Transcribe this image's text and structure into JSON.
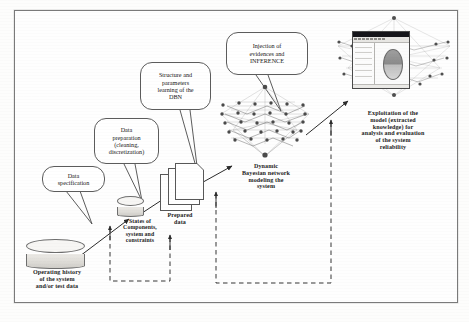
{
  "figure": {
    "border_color": "#7a7a7a"
  },
  "callouts": [
    {
      "id": "data-specification",
      "text": "Data\nspecification"
    },
    {
      "id": "data-preparation",
      "text": "Data\npreparation\n(cleaning,\ndiscretization)"
    },
    {
      "id": "structure-parameters",
      "text": "Structure and\nparameters\nlearning of the\nDBN"
    },
    {
      "id": "injection-inference",
      "text": "Injection of\nevidences  and\nINFERENCE"
    }
  ],
  "nodes": {
    "operating_history": {
      "label": "Operating history\nof the system\nand/or test data",
      "icon": "database-cylinder"
    },
    "states_components": {
      "label": "States of\nComponents,\nsystem and\nconstraints",
      "icon": "database-cylinder"
    },
    "prepared_data": {
      "label": "Prepared\ndata",
      "icon": "document-stack"
    },
    "dbn_model": {
      "label": "Dynamic\nBayesian network\nmodeling the\nsystem",
      "icon": "network-graph"
    },
    "exploitation": {
      "label": "Exploitation of the\nmodel (extracted\nknowledge) for\nanalysis and evaluation\nof the system\nreliability",
      "icon": "app-window-screenshot"
    }
  },
  "connectors": {
    "solid_arrow_count": 5,
    "dashed_feedback_count": 2,
    "style": "dashed feedback loops returning from model and exploitation stages to the data stages"
  }
}
